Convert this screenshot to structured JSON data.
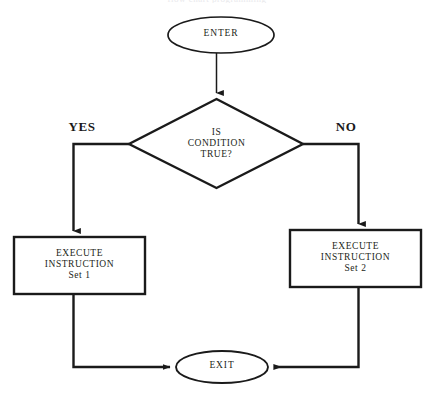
{
  "diagram": {
    "title_clipped": "flow chart programming",
    "stroke_color": "#1a1a1a",
    "text_color": "#231f20",
    "background_color": "#ffffff",
    "nodes": {
      "enter": {
        "label": "ENTER",
        "shape": "ellipse"
      },
      "decision": {
        "label": "IS\nCONDITION\nTRUE?",
        "shape": "diamond"
      },
      "execute_yes": {
        "label": "EXECUTE\nINSTRUCTION\nSet 1",
        "shape": "rectangle"
      },
      "execute_no": {
        "label": "EXECUTE\nINSTRUCTION\nSet 2",
        "shape": "rectangle"
      },
      "exit": {
        "label": "EXIT",
        "shape": "ellipse"
      }
    },
    "branches": {
      "yes": "YES",
      "no": "NO"
    }
  }
}
